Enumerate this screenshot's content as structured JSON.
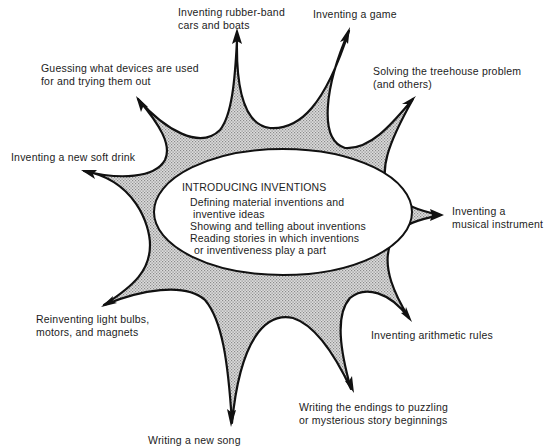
{
  "diagram": {
    "type": "web / starburst concept map",
    "colors": {
      "outline": "#111111",
      "fill_pattern": "#9a9a9a",
      "fill_background": "#d8d8d8",
      "ellipse_fill": "#ffffff"
    },
    "center": {
      "title": "INTRODUCING INVENTIONS",
      "items": [
        {
          "line1": "Defining material inventions and",
          "line2": "inventive ideas"
        },
        {
          "line1": "Showing and telling about inventions",
          "line2": ""
        },
        {
          "line1": "Reading stories in which inventions",
          "line2": "or inventiveness play a part"
        }
      ]
    },
    "branches": [
      {
        "id": "rubber-band",
        "lines": [
          "Inventing rubber-band",
          "cars and boats"
        ]
      },
      {
        "id": "game",
        "lines": [
          "Inventing a game"
        ]
      },
      {
        "id": "treehouse",
        "lines": [
          "Solving the treehouse problem",
          "(and others)"
        ]
      },
      {
        "id": "musical-instrument",
        "lines": [
          "Inventing a",
          "musical instrument"
        ]
      },
      {
        "id": "arithmetic",
        "lines": [
          "Inventing arithmetic rules"
        ]
      },
      {
        "id": "story-endings",
        "lines": [
          "Writing the endings to puzzling",
          "or mysterious story beginnings"
        ]
      },
      {
        "id": "new-song",
        "lines": [
          "Writing a new song"
        ]
      },
      {
        "id": "light-bulbs",
        "lines": [
          "Reinventing light bulbs,",
          "motors, and magnets"
        ]
      },
      {
        "id": "soft-drink",
        "lines": [
          "Inventing a new soft drink"
        ]
      },
      {
        "id": "guessing-devices",
        "lines": [
          "Guessing what devices are used",
          "for and trying them out"
        ]
      }
    ]
  }
}
